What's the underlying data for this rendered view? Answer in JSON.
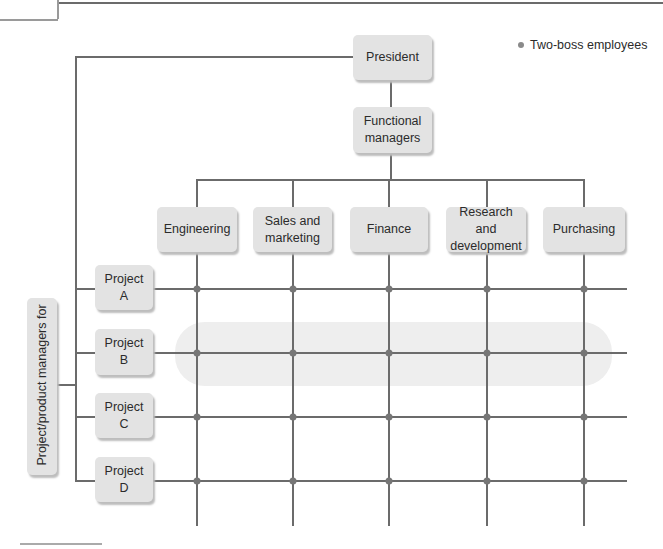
{
  "legend": {
    "label": "Two-boss employees",
    "icon": "dot-icon"
  },
  "top": {
    "president": "President",
    "functional_managers": "Functional managers"
  },
  "departments": [
    {
      "label": "Engineering"
    },
    {
      "label": "Sales and marketing"
    },
    {
      "label": "Finance"
    },
    {
      "label": "Research and development"
    },
    {
      "label": "Purchasing"
    }
  ],
  "projects": [
    {
      "label": "Project A"
    },
    {
      "label": "Project B"
    },
    {
      "label": "Project C"
    },
    {
      "label": "Project D"
    }
  ],
  "side_label": "Project/product managers for",
  "highlighted_row": "Project B",
  "colors": {
    "box": "#e3e3e3",
    "line": "#6b6b6b",
    "highlight": "#eeeeee",
    "dot": "#767676"
  }
}
